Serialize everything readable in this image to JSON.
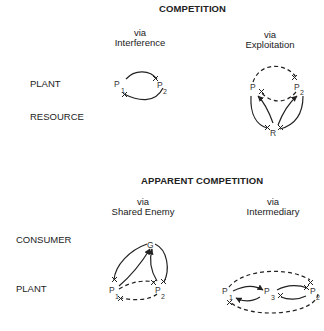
{
  "competition": {
    "title": "COMPETITION",
    "panels": [
      {
        "via": "via",
        "name": "Interference"
      },
      {
        "via": "via",
        "name": "Exploitation"
      }
    ],
    "rows": [
      "PLANT",
      "RESOURCE"
    ]
  },
  "apparent_competition": {
    "title": "APPARENT COMPETITION",
    "panels": [
      {
        "via": "via",
        "name": "Shared Enemy"
      },
      {
        "via": "via",
        "name": "Intermediary"
      }
    ],
    "rows": [
      "CONSUMER",
      "PLANT"
    ]
  },
  "nodes": {
    "p": "P",
    "sub1": "1",
    "sub2": "2",
    "sub3": "3",
    "r": "R",
    "g": "G"
  },
  "legend_notation": {
    "solid_arrow": "positive effect",
    "cross_end": "negative effect",
    "dashed_line": "indirect effect"
  },
  "colors": {
    "ink": "#222222",
    "background": "#ffffff"
  }
}
